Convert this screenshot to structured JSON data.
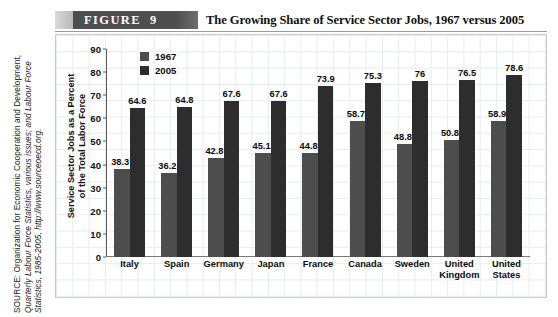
{
  "figure": {
    "label": "FIGURE",
    "number": "9",
    "title": "The Growing Share of Service Sector Jobs, 1967 versus 2005"
  },
  "source": {
    "line1": "SOURCE: Organization for Economic Cooperation and Development,",
    "line2": "Quarterly Labour Force Statistics, various issues; and Labour Force",
    "line3": "Statistics, 1985-2005, http://www.sourceoecd.org."
  },
  "colors": {
    "series_1967": "#4d4d4d",
    "series_2005": "#2d2d2d",
    "band_dark": "#4e4e4e",
    "grid": "#dfe6ec",
    "axis": "#5a5a5a"
  },
  "chart_data": {
    "type": "bar",
    "title": "The Growing Share of Service Sector Jobs, 1967 versus 2005",
    "xlabel": "",
    "ylabel": "Service Sector Jobs as a Percent of the Total Labor Force",
    "ylabel_line1": "Service Sector Jobs as a Percent",
    "ylabel_line2": "of the Total Labor Force",
    "ylim": [
      0,
      90
    ],
    "yticks": [
      0,
      10,
      20,
      30,
      40,
      50,
      60,
      70,
      80,
      90
    ],
    "ytick_labels": [
      "0",
      "10",
      "20",
      "30",
      "40",
      "50",
      "60",
      "70",
      "80",
      "90"
    ],
    "grid": true,
    "legend_position": "top-left",
    "categories": [
      "Italy",
      "Spain",
      "Germany",
      "Japan",
      "France",
      "Canada",
      "Sweden",
      "United Kingdom",
      "United States"
    ],
    "category_lines": [
      [
        "Italy"
      ],
      [
        "Spain"
      ],
      [
        "Germany"
      ],
      [
        "Japan"
      ],
      [
        "France"
      ],
      [
        "Canada"
      ],
      [
        "Sweden"
      ],
      [
        "United",
        "Kingdom"
      ],
      [
        "United",
        "States"
      ]
    ],
    "series": [
      {
        "name": "1967",
        "values": [
          38.3,
          36.2,
          42.8,
          45.1,
          44.8,
          58.7,
          48.8,
          50.8,
          58.9
        ],
        "labels": [
          "38.3",
          "36.2",
          "42.8",
          "45.1",
          "44.8",
          "58.7",
          "48.8",
          "50.8",
          "58.9"
        ],
        "color": "#4d4d4d"
      },
      {
        "name": "2005",
        "values": [
          64.6,
          64.8,
          67.6,
          67.6,
          73.9,
          75.3,
          76,
          76.5,
          78.6
        ],
        "labels": [
          "64.6",
          "64.8",
          "67.6",
          "67.6",
          "73.9",
          "75.3",
          "76",
          "76.5",
          "78.6"
        ],
        "color": "#2d2d2d"
      }
    ]
  },
  "legend": {
    "entries": [
      {
        "label": "1967"
      },
      {
        "label": "2005"
      }
    ]
  }
}
